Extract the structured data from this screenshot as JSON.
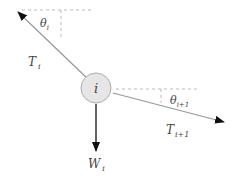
{
  "diagram": {
    "node": {
      "label": "i",
      "fill": "#e6e6e6",
      "stroke": "#aaaaaa"
    },
    "forces": [
      {
        "name": "T",
        "subscript": "i",
        "direction": "upper-left"
      },
      {
        "name": "T",
        "subscript": "i+1",
        "direction": "lower-right"
      },
      {
        "name": "W",
        "subscript": "i",
        "direction": "down"
      }
    ],
    "angles": [
      {
        "name": "θ",
        "subscript": "i"
      },
      {
        "name": "θ",
        "subscript": "i+1"
      }
    ],
    "colors": {
      "arrow": "#111111",
      "line": "#999999",
      "dashed": "#bbbbbb",
      "text": "#444444"
    }
  }
}
